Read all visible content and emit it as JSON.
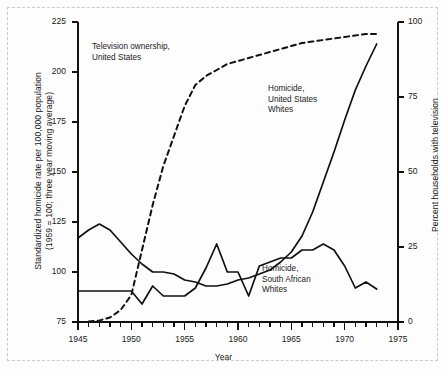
{
  "figure": {
    "background": "#fdfdfd",
    "line_color": "#111111",
    "border_color": "#c9c9c9"
  },
  "chart_data": {
    "type": "line",
    "title": "",
    "xlabel": "Year",
    "ylabel": "Standardized homicide rate per 100,000 population (1959 = 100; three year moving average)",
    "ylabel_left_line1": "Standardized homicide rate per 100,000 population",
    "ylabel_left_line2": "(1959 = 100; three year moving average)",
    "ylabel_right": "Percent households with television",
    "xlim": [
      1945,
      1975
    ],
    "ylim": [
      75,
      225
    ],
    "ylim_right": [
      0,
      100
    ],
    "yticks": [
      75,
      100,
      125,
      150,
      175,
      200,
      225
    ],
    "yticks_right": [
      0,
      25,
      50,
      75,
      100
    ],
    "xticks": [
      1945,
      1950,
      1955,
      1960,
      1965,
      1970,
      1975
    ],
    "xtick_minor_step": 1,
    "grid": false,
    "legend": "annotations",
    "series": [
      {
        "name": "Homicide, United States Whites",
        "label_lines": [
          "Homicide,",
          "United States",
          "Whites"
        ],
        "axis": "left",
        "style": "solid",
        "x": [
          1945,
          1946,
          1947,
          1948,
          1949,
          1950,
          1951,
          1952,
          1953,
          1954,
          1955,
          1956,
          1957,
          1958,
          1959,
          1960,
          1961,
          1962,
          1963,
          1964,
          1965,
          1966,
          1967,
          1968,
          1969,
          1970,
          1971,
          1972,
          1973
        ],
        "values": [
          117,
          121,
          124,
          121,
          115,
          109,
          104,
          100,
          100,
          99,
          96,
          95,
          93,
          93,
          94,
          96,
          97,
          99,
          101,
          105,
          110,
          118,
          130,
          145,
          160,
          176,
          191,
          203,
          214
        ]
      },
      {
        "name": "Homicide, South African Whites",
        "label_lines": [
          "Homicide,",
          "South African",
          "Whites"
        ],
        "axis": "left",
        "style": "solid",
        "x": [
          1945,
          1946,
          1947,
          1948,
          1949,
          1950,
          1951,
          1952,
          1953,
          1954,
          1955,
          1956,
          1957,
          1958,
          1959,
          1960,
          1961,
          1962,
          1963,
          1964,
          1965,
          1966,
          1967,
          1968,
          1969,
          1970,
          1971,
          1972,
          1973
        ],
        "values": [
          90.5,
          90.5,
          90.5,
          90.5,
          90.5,
          90.5,
          84,
          93,
          88,
          88,
          88,
          92,
          102,
          114,
          100,
          100,
          88,
          103,
          105,
          107,
          107,
          111,
          111,
          114,
          111,
          103,
          92,
          95,
          91.5
        ]
      },
      {
        "name": "Television ownership, United States",
        "label_lines": [
          "Television ownership,",
          "United States"
        ],
        "axis": "right",
        "style": "dashed",
        "x": [
          1946,
          1947,
          1948,
          1949,
          1950,
          1951,
          1952,
          1953,
          1954,
          1955,
          1956,
          1957,
          1958,
          1959,
          1960,
          1961,
          1962,
          1963,
          1964,
          1965,
          1966,
          1967,
          1968,
          1969,
          1970,
          1971,
          1972,
          1973
        ],
        "values": [
          0.2,
          0.5,
          1.5,
          4,
          9,
          24,
          39,
          52,
          62,
          72,
          79,
          82,
          84,
          86,
          87,
          88,
          89,
          90,
          91,
          92,
          93,
          93.5,
          94,
          94.5,
          95,
          95.5,
          96,
          96
        ]
      }
    ],
    "annotations": [
      {
        "name": "television-ownership-label",
        "text": "Television ownership,\nUnited States"
      },
      {
        "name": "homicide-us-whites-label",
        "text": "Homicide,\nUnited States\nWhites"
      },
      {
        "name": "homicide-sa-whites-label",
        "text": "Homicide,\nSouth African\nWhites"
      }
    ]
  }
}
